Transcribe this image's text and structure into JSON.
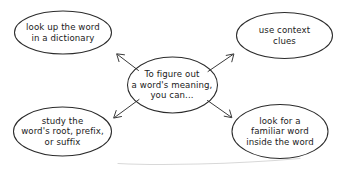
{
  "diagram": {
    "type": "concept-map",
    "title": "To figure out a word's meaning, you can...",
    "ink_color": "#2b2b2b",
    "background_color": "#ffffff",
    "center": {
      "id": "center",
      "label": "To figure out\na word's meaning,\nyou can...",
      "shape": "ellipse"
    },
    "branches": [
      {
        "id": "dictionary",
        "label": "look up the word\nin a dictionary",
        "shape": "ellipse",
        "position": "top-left",
        "arrow_from": "center"
      },
      {
        "id": "context",
        "label": "use context\nclues",
        "shape": "ellipse",
        "position": "top-right",
        "arrow_from": "center"
      },
      {
        "id": "roots",
        "label": "study the\nword's root, prefix,\nor suffix",
        "shape": "ellipse",
        "position": "bottom-left",
        "arrow_from": "center"
      },
      {
        "id": "familiar",
        "label": "look for a\nfamiliar word\ninside the word",
        "shape": "ellipse",
        "position": "bottom-right",
        "arrow_from": "center"
      }
    ],
    "connectors": [
      {
        "id": "center-to-dictionary",
        "style": "arrow",
        "direction": "up-left"
      },
      {
        "id": "center-to-context",
        "style": "arrow",
        "direction": "up-right"
      },
      {
        "id": "center-to-roots",
        "style": "arrow",
        "direction": "down-left"
      },
      {
        "id": "center-to-familiar",
        "style": "arrow",
        "direction": "down-right"
      }
    ]
  }
}
